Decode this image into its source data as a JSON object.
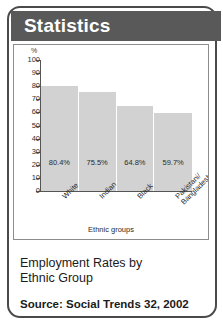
{
  "header": {
    "title": "Statistics"
  },
  "chart_data": {
    "type": "bar",
    "title": "",
    "categories": [
      "White",
      "Indian",
      "Black",
      "Pakistani/\nBangladeshi"
    ],
    "values": [
      80.4,
      75.5,
      64.8,
      59.7
    ],
    "value_labels": [
      "80.4%",
      "75.5%",
      "64.8%",
      "59.7%"
    ],
    "xlabel": "Ethnic groups",
    "ylabel": "%",
    "ylim": [
      0,
      100
    ],
    "yticks": [
      100,
      90,
      80,
      70,
      60,
      50,
      40,
      30,
      20,
      10,
      0
    ],
    "ytick_labels": [
      "100",
      "90",
      "80",
      "70",
      "60",
      "50",
      "40",
      "30",
      "20",
      "10",
      "0"
    ],
    "grid": false,
    "legend": "none",
    "bar_color": "#d2d2d2"
  },
  "caption": {
    "line1": "Employment Rates by",
    "line2": "Ethnic Group"
  },
  "source": {
    "text": "Source: Social Trends 32, 2002"
  },
  "colors": {
    "header_bg": "#595959",
    "frame": "#4a4a4a",
    "bar": "#d2d2d2"
  }
}
